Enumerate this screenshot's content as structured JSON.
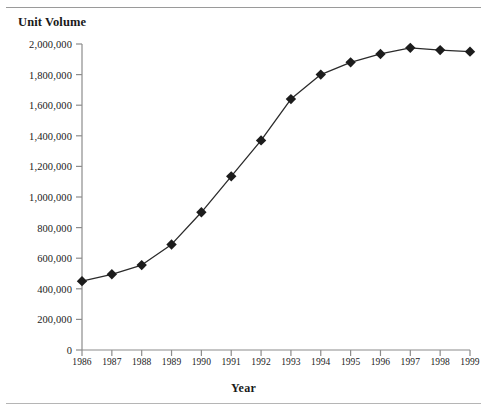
{
  "figure": {
    "title": "Unit Volume",
    "xaxis_title": "Year",
    "has_top_rule": true,
    "has_bottom_rule": true,
    "line_color": "#2b2b2b",
    "marker_color": "#1c1c1c",
    "axis_color": "#8c8c8c",
    "background": "#ffffff"
  },
  "chart_data": {
    "type": "line",
    "title": "Unit Volume",
    "xlabel": "Year",
    "ylabel": "Unit Volume",
    "grid": false,
    "legend": "none",
    "marker": "diamond",
    "x": [
      1986,
      1987,
      1988,
      1989,
      1990,
      1991,
      1992,
      1993,
      1994,
      1995,
      1996,
      1997,
      1998,
      1999
    ],
    "categories": [
      "1986",
      "1987",
      "1988",
      "1989",
      "1990",
      "1991",
      "1992",
      "1993",
      "1994",
      "1995",
      "1996",
      "1997",
      "1998",
      "1999"
    ],
    "values": [
      450000,
      495000,
      555000,
      690000,
      900000,
      1135000,
      1370000,
      1640000,
      1800000,
      1880000,
      1935000,
      1975000,
      1960000,
      1950000
    ],
    "series": [
      {
        "name": "Unit Volume",
        "values": [
          450000,
          495000,
          555000,
          690000,
          900000,
          1135000,
          1370000,
          1640000,
          1800000,
          1880000,
          1935000,
          1975000,
          1960000,
          1950000
        ]
      }
    ],
    "xlim": [
      1986,
      1999
    ],
    "ylim": [
      0,
      2000000
    ],
    "ytick_values": [
      0,
      200000,
      400000,
      600000,
      800000,
      1000000,
      1200000,
      1400000,
      1600000,
      1800000,
      2000000
    ],
    "ytick_labels": [
      "0",
      "200,000",
      "400,000",
      "600,000",
      "800,000",
      "1,000,000",
      "1,200,000",
      "1,400,000",
      "1,600,000",
      "1,800,000",
      "2,000,000"
    ],
    "xtick_labels": [
      "1986",
      "1987",
      "1988",
      "1989",
      "1990",
      "1991",
      "1992",
      "1993",
      "1994",
      "1995",
      "1996",
      "1997",
      "1998",
      "1999"
    ]
  }
}
